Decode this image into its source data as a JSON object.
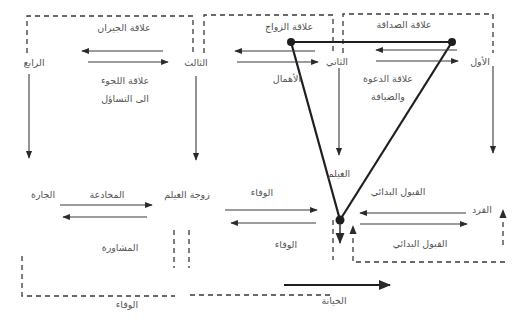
{
  "diagram": {
    "nodes": {
      "first": "الأول",
      "second": "الثاني",
      "third": "الثالث",
      "fourth": "الرابع",
      "heron_wife": "زوجة الغيلم",
      "neighbor_f": "الجارة",
      "heron": "الغيلم",
      "monkey": "القرد"
    },
    "relations": {
      "friendship": "علاقة الصداقة",
      "marriage": "علاقة الزواج",
      "neighbors": "علاقة الجيران",
      "refuge_line1": "علاقة اللجوء",
      "refuge_line2": "الى التساؤل",
      "invitation_line1": "علاقة الدعوة",
      "invitation_line2": "والضيافة",
      "neglect": "الأهمال",
      "deception": "المخادعة",
      "consultation": "المشاورة",
      "loyalty_top": "الوفاء",
      "loyalty_bottom": "الوفاء",
      "loyalty_dashed": "الوفاء",
      "initial_acceptance_top": "القبول البدائي",
      "initial_acceptance_bottom": "القبول البدائي",
      "betrayal": "الخيانة"
    },
    "colors": {
      "text": "#555555",
      "line": "#3a3a3a",
      "triangle": "#1e1e1e"
    }
  }
}
